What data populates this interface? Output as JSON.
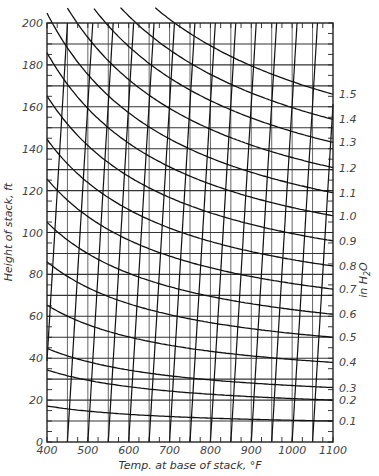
{
  "chart_data": {
    "type": "line",
    "title": "",
    "xlabel": "Temp. at base of stack, °F",
    "ylabel": "Height of stack, ft",
    "y2label": "in H2O",
    "xlim": [
      400,
      1100
    ],
    "ylim": [
      0,
      200
    ],
    "x_ticks": [
      400,
      500,
      600,
      700,
      800,
      900,
      1000,
      1100
    ],
    "y_ticks": [
      0,
      20,
      40,
      60,
      80,
      100,
      120,
      140,
      160,
      180,
      200
    ],
    "grid": {
      "x_step": 50,
      "y_step": 10,
      "on": true
    },
    "draft_curves": {
      "unit": "in H2O",
      "series": [
        {
          "name": "0.1",
          "right_height": 10
        },
        {
          "name": "0.2",
          "right_height": 20
        },
        {
          "name": "0.3",
          "right_height": 26
        },
        {
          "name": "0.4",
          "right_height": 38
        },
        {
          "name": "0.5",
          "right_height": 50
        },
        {
          "name": "0.6",
          "right_height": 61
        },
        {
          "name": "0.7",
          "right_height": 73
        },
        {
          "name": "0.8",
          "right_height": 84
        },
        {
          "name": "0.9",
          "right_height": 96
        },
        {
          "name": "1.0",
          "right_height": 108
        },
        {
          "name": "1.1",
          "right_height": 119
        },
        {
          "name": "1.2",
          "right_height": 131
        },
        {
          "name": "1.3",
          "right_height": 143
        },
        {
          "name": "1.4",
          "right_height": 154
        },
        {
          "name": "1.5",
          "right_height": 166
        }
      ]
    },
    "steep_lines": {
      "bottom_temps": [
        450,
        500,
        550,
        600,
        650,
        700,
        750,
        800,
        850,
        900,
        950,
        1000,
        1050,
        1100
      ],
      "temp_span_over_full_height": 62
    },
    "right_labels": [
      "1.5",
      "1.4",
      "1.3",
      "1.2",
      "1.1",
      "1.0",
      "0.9",
      "0.8",
      "0.7",
      "0.6",
      "0.5",
      "0.4",
      "0.3",
      "0.2",
      "0.1"
    ]
  }
}
